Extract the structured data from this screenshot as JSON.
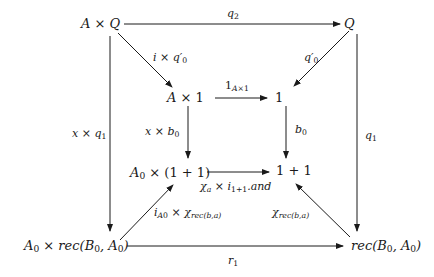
{
  "diagram": {
    "type": "commutative-diagram",
    "nodes": {
      "AxQ": "A × Q",
      "Q": "Q",
      "Ax1": "A × 1",
      "one": "1",
      "A0x1p1": "A₀ × (1 + 1)",
      "onep1": "1 + 1",
      "A0xrec": "A₀ × rec(B₀, A₀)",
      "rec": "rec(B₀, A₀)"
    },
    "edges": {
      "q2": "q₂",
      "i_x_q0p": "i × q′₀",
      "q0p": "q′₀",
      "one_Ax1": "1_{A×1}",
      "x_x_q1": "x × q₁",
      "x_x_b0": "x × b₀",
      "b0": "b₀",
      "q1": "q₁",
      "chi_a_x_i": "χ_a × i_{1+1}.and",
      "iA0_x_chirec": "i_{A₀} × χ_{rec(b,a)}",
      "chirec": "χ_{rec(b,a)}",
      "r1": "r₁"
    },
    "colors": {
      "ink": "#1a1a1a",
      "background": "#ffffff"
    }
  }
}
